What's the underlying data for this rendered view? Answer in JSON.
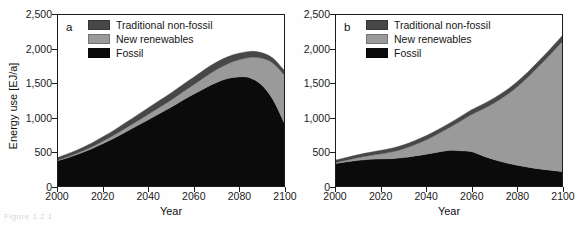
{
  "figure": {
    "caption_fragment": "Figure 1.2.1",
    "panels": [
      "a",
      "b"
    ]
  },
  "axes": {
    "ylabel": "Energy use [EJ/a]",
    "xlabel": "Year",
    "yticks": [
      "0",
      "500",
      "1,000",
      "1,500",
      "2,000",
      "2,500"
    ],
    "ytick_values": [
      0,
      500,
      1000,
      1500,
      2000,
      2500
    ],
    "xticks": [
      "2000",
      "2020",
      "2040",
      "2060",
      "2080",
      "2100"
    ],
    "xtick_values": [
      2000,
      2020,
      2040,
      2060,
      2080,
      2100
    ],
    "ylim": [
      0,
      2500
    ],
    "xlim": [
      2000,
      2100
    ]
  },
  "legend": {
    "position": "top-left inside plot",
    "items": [
      {
        "label": "Traditional non-fossil",
        "color": "#474747"
      },
      {
        "label": "New renewables",
        "color": "#9a9a9a"
      },
      {
        "label": "Fossil",
        "color": "#0b0b0b"
      }
    ]
  },
  "colors": {
    "traditional_non_fossil": "#474747",
    "new_renewables": "#9a9a9a",
    "fossil": "#0b0b0b",
    "axis": "#1c1c1c",
    "background": "#ffffff"
  },
  "chart_data": [
    {
      "type": "area",
      "stacked": true,
      "panel": "a",
      "title": "a",
      "xlabel": "Year",
      "ylabel": "Energy use [EJ/a]",
      "xlim": [
        2000,
        2100
      ],
      "ylim": [
        0,
        2500
      ],
      "grid": false,
      "legend_position": "upper-left",
      "x": [
        2000,
        2005,
        2010,
        2015,
        2020,
        2025,
        2030,
        2035,
        2040,
        2045,
        2050,
        2055,
        2060,
        2065,
        2070,
        2075,
        2080,
        2085,
        2090,
        2095,
        2100
      ],
      "series": [
        {
          "name": "Fossil",
          "color": "#0b0b0b",
          "values": [
            370,
            420,
            480,
            545,
            620,
            700,
            790,
            880,
            970,
            1060,
            1150,
            1250,
            1340,
            1430,
            1510,
            1570,
            1595,
            1580,
            1480,
            1270,
            930
          ]
        },
        {
          "name": "New renewables",
          "color": "#9a9a9a",
          "values": [
            10,
            15,
            20,
            28,
            38,
            48,
            58,
            68,
            80,
            92,
            105,
            120,
            140,
            165,
            190,
            215,
            250,
            300,
            390,
            530,
            700
          ]
        },
        {
          "name": "Traditional non-fossil",
          "color": "#474747",
          "values": [
            40,
            45,
            50,
            57,
            65,
            72,
            80,
            88,
            95,
            100,
            105,
            108,
            110,
            110,
            108,
            103,
            95,
            88,
            80,
            72,
            65
          ]
        }
      ],
      "totals": [
        420,
        480,
        550,
        630,
        723,
        820,
        928,
        1036,
        1145,
        1252,
        1360,
        1478,
        1590,
        1705,
        1808,
        1888,
        1940,
        1968,
        1950,
        1872,
        1695
      ]
    },
    {
      "type": "area",
      "stacked": true,
      "panel": "b",
      "title": "b",
      "xlabel": "Year",
      "ylabel": "Energy use [EJ/a]",
      "xlim": [
        2000,
        2100
      ],
      "ylim": [
        0,
        2500
      ],
      "grid": false,
      "legend_position": "upper-left",
      "x": [
        2000,
        2005,
        2010,
        2015,
        2020,
        2025,
        2030,
        2035,
        2040,
        2045,
        2050,
        2055,
        2060,
        2065,
        2070,
        2075,
        2080,
        2085,
        2090,
        2095,
        2100
      ],
      "series": [
        {
          "name": "Fossil",
          "color": "#0b0b0b",
          "values": [
            330,
            355,
            375,
            390,
            395,
            400,
            415,
            440,
            465,
            495,
            520,
            515,
            500,
            440,
            385,
            340,
            305,
            275,
            250,
            230,
            210
          ]
        },
        {
          "name": "New renewables",
          "color": "#9a9a9a",
          "values": [
            15,
            25,
            40,
            55,
            75,
            100,
            130,
            165,
            210,
            265,
            330,
            430,
            545,
            685,
            830,
            980,
            1140,
            1320,
            1510,
            1700,
            1900
          ]
        },
        {
          "name": "Traditional non-fossil",
          "color": "#474747",
          "values": [
            35,
            40,
            45,
            48,
            52,
            55,
            58,
            60,
            62,
            63,
            65,
            68,
            70,
            72,
            73,
            74,
            75,
            76,
            78,
            80,
            82
          ]
        }
      ],
      "totals": [
        380,
        420,
        460,
        493,
        522,
        555,
        603,
        665,
        737,
        823,
        915,
        1013,
        1115,
        1197,
        1288,
        1394,
        1520,
        1671,
        1838,
        2010,
        2192
      ]
    }
  ]
}
